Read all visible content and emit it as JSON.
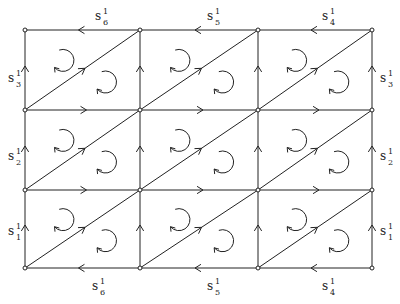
{
  "diagram": {
    "type": "triangulated torus / grid complex",
    "grid": {
      "xs": [
        25,
        140,
        258,
        372
      ],
      "ys": [
        30,
        110,
        190,
        268
      ]
    },
    "labels": {
      "top": [
        {
          "base": "s",
          "sup": "1",
          "sub": "6",
          "x": 95,
          "y": 20
        },
        {
          "base": "s",
          "sup": "1",
          "sub": "5",
          "x": 207,
          "y": 20
        },
        {
          "base": "s",
          "sup": "1",
          "sub": "4",
          "x": 322,
          "y": 20
        }
      ],
      "bottom": [
        {
          "base": "s",
          "sup": "1",
          "sub": "6",
          "x": 92,
          "y": 290
        },
        {
          "base": "s",
          "sup": "1",
          "sub": "5",
          "x": 207,
          "y": 290
        },
        {
          "base": "s",
          "sup": "1",
          "sub": "4",
          "x": 322,
          "y": 290
        }
      ],
      "left": [
        {
          "base": "s",
          "sup": "1",
          "sub": "3",
          "x": 8,
          "y": 82
        },
        {
          "base": "s",
          "sup": "1",
          "sub": "2",
          "x": 8,
          "y": 160
        },
        {
          "base": "s",
          "sup": "1",
          "sub": "1",
          "x": 8,
          "y": 235
        }
      ],
      "right": [
        {
          "base": "s",
          "sup": "1",
          "sub": "3",
          "x": 380,
          "y": 82
        },
        {
          "base": "s",
          "sup": "1",
          "sub": "2",
          "x": 380,
          "y": 160
        },
        {
          "base": "s",
          "sup": "1",
          "sub": "1",
          "x": 380,
          "y": 235
        }
      ]
    }
  }
}
